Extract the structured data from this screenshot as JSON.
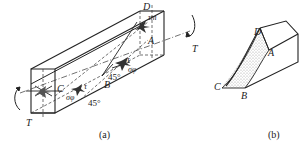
{
  "figure": {
    "panel_a": {
      "caption": "(a)",
      "points": {
        "A": "A",
        "B": "B",
        "C": "C",
        "D": "D"
      },
      "torque_label_right": "T",
      "torque_label_left": "T",
      "stress_labels": {
        "tau": "τ",
        "sigma_phi": "σφ",
        "tau_max": "τm"
      },
      "angle_labels": [
        "45°",
        "45°"
      ]
    },
    "panel_b": {
      "caption": "(b)",
      "points": {
        "A": "A",
        "B": "B",
        "C": "C",
        "D": "D"
      }
    },
    "colors": {
      "line": "#222222",
      "fill_stipple": "#bbbbbb",
      "background": "#ffffff"
    }
  }
}
